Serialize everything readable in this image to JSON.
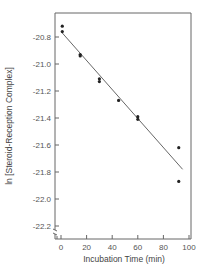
{
  "chart_data": {
    "type": "scatter",
    "title": "",
    "xlabel": "Incubation Time (min)",
    "ylabel": "ln [Steroid-Reception Complex]",
    "xlim": [
      -5,
      100
    ],
    "ylim": [
      -22.3,
      -20.62
    ],
    "x_ticks": [
      0,
      20,
      40,
      60,
      80,
      100
    ],
    "x_tick_labels": [
      "0",
      "20",
      "40",
      "60",
      "80",
      "100"
    ],
    "y_ticks": [
      -20.8,
      -21.0,
      -21.2,
      -21.4,
      -21.6,
      -21.8,
      -22.0,
      -22.2
    ],
    "y_tick_labels": [
      "-20.8",
      "-21.0",
      "-21.2",
      "-21.4",
      "-21.6",
      "-21.8",
      "-22.0",
      "-22.2"
    ],
    "grid": false,
    "legend": null,
    "series": [
      {
        "name": "measurements",
        "type": "scatter",
        "x": [
          1,
          1,
          15,
          15,
          30,
          30,
          45,
          60,
          60,
          92,
          92
        ],
        "y": [
          -20.72,
          -20.76,
          -20.93,
          -20.94,
          -21.11,
          -21.13,
          -21.27,
          -21.39,
          -21.41,
          -21.62,
          -21.87
        ]
      },
      {
        "name": "linear fit",
        "type": "line",
        "x": [
          1,
          95
        ],
        "y": [
          -20.77,
          -21.78
        ]
      }
    ],
    "axis_break": "y-axis break near bottom left (between -22.2 and origin)"
  }
}
